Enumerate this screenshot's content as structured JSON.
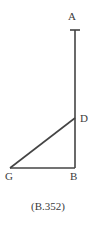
{
  "figure": {
    "caption": "(B.352)",
    "stroke_color": "#444444",
    "background_color": "#ffffff",
    "label_color": "#3b3b3b",
    "stroke_width": 1.6,
    "points": {
      "A": {
        "label": "A",
        "x": 75,
        "y": 30
      },
      "D": {
        "label": "D",
        "x": 75,
        "y": 118
      },
      "B": {
        "label": "B",
        "x": 75,
        "y": 168
      },
      "G": {
        "label": "G",
        "x": 10,
        "y": 168
      }
    },
    "segments": [
      {
        "name": "segment-AB",
        "from": "A",
        "to": "B"
      },
      {
        "name": "segment-GB",
        "from": "G",
        "to": "B"
      },
      {
        "name": "segment-GD",
        "from": "G",
        "to": "D"
      }
    ],
    "tick_cap": {
      "name": "tick-cap-A",
      "x1": 70,
      "x2": 80,
      "y": 30
    }
  }
}
